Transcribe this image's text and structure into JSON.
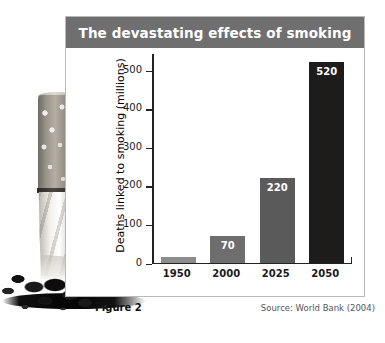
{
  "figure": {
    "title": "The devastating effects of smoking",
    "caption": "Figure 2",
    "source": "Source: World Bank (2004)",
    "photo_alt": "crushed-cigarette-photo"
  },
  "colors": {
    "title_banner": "#6f6f6f",
    "panel_border": "#b9b9b9",
    "axis": "#222222",
    "bar_1950": "#8c8c8c",
    "bar_2000": "#6e6e6e",
    "bar_2025": "#5a5a5a",
    "bar_2050": "#1e1c1b",
    "value_label": "#ffffff"
  },
  "chart_data": {
    "type": "bar",
    "title": "The devastating effects of smoking",
    "categories": [
      "1950",
      "2000",
      "2025",
      "2050"
    ],
    "values": [
      15,
      70,
      220,
      520
    ],
    "value_labels": [
      "",
      "70",
      "220",
      "520"
    ],
    "bar_colors": [
      "#8c8c8c",
      "#6e6e6e",
      "#5a5a5a",
      "#1e1c1b"
    ],
    "xlabel": "",
    "ylabel": "Deaths linked to smoking (millions)",
    "ylim": [
      0,
      540
    ],
    "yticks": [
      0,
      100,
      200,
      300,
      400,
      500
    ],
    "ytick_labels": [
      "0",
      "100",
      "200",
      "300",
      "400",
      "500"
    ],
    "grid": false,
    "legend": false,
    "source": "Source: World Bank (2004)"
  }
}
